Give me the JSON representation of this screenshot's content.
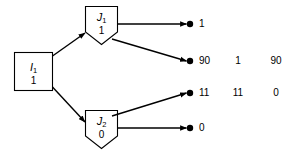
{
  "diagram": {
    "type": "decision-tree",
    "nodes": [
      {
        "id": "I1",
        "shape": "square",
        "name": "I",
        "subscript": "1",
        "value": "1"
      },
      {
        "id": "J1",
        "shape": "shield",
        "name": "J",
        "subscript": "1",
        "value": "1"
      },
      {
        "id": "J2",
        "shape": "shield",
        "name": "J",
        "subscript": "2",
        "value": "0"
      }
    ],
    "terminals": [
      {
        "id": "t1",
        "value": "1"
      },
      {
        "id": "t2",
        "value": "90"
      },
      {
        "id": "t3",
        "value": "11"
      },
      {
        "id": "t4",
        "value": "0"
      }
    ],
    "columns": [
      {
        "row": "t2",
        "col1": "1",
        "col2": "90"
      },
      {
        "row": "t3",
        "col1": "11",
        "col2": "0"
      }
    ],
    "edges": [
      {
        "from": "I1",
        "to": "J1"
      },
      {
        "from": "I1",
        "to": "J2"
      },
      {
        "from": "J1",
        "to": "t1"
      },
      {
        "from": "J1",
        "to": "t2"
      },
      {
        "from": "J2",
        "to": "t3"
      },
      {
        "from": "J2",
        "to": "t4"
      }
    ],
    "colors": {
      "stroke": "#000000",
      "fill": "#ffffff",
      "text": "#000000",
      "background": "#ffffff"
    }
  }
}
